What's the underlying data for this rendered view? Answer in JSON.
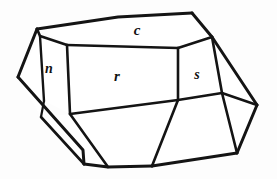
{
  "figure": {
    "name": "crystal-habit-drawing",
    "background_color": "#fdfdfd",
    "line_color": "#141414",
    "face_fill_color": "#ffffff",
    "canvas": {
      "width": 277,
      "height": 179
    }
  },
  "labels": [
    {
      "id": "face-label-c",
      "text": "c",
      "x": 137,
      "y": 32,
      "size": 15
    },
    {
      "id": "face-label-n",
      "text": "n",
      "x": 49,
      "y": 70,
      "size": 14
    },
    {
      "id": "face-label-r",
      "text": "r",
      "x": 117,
      "y": 78,
      "size": 15
    },
    {
      "id": "face-label-s",
      "text": "s",
      "x": 197,
      "y": 76,
      "size": 14
    }
  ],
  "faces": [
    {
      "id": "face-c",
      "label": "c",
      "points": "37,29 118,17 192,13 212,37 178,48 68,44"
    },
    {
      "id": "face-n",
      "label": "n",
      "points": "40,36 67,45 70,114 44,101"
    },
    {
      "id": "face-r",
      "label": "r",
      "points": "67,45 178,48 178,100 70,114"
    },
    {
      "id": "face-s",
      "label": "s",
      "points": "178,48 212,37 222,93 178,100"
    },
    {
      "id": "face-left-sliver",
      "points": "18,77 40,36 44,101 41,117"
    },
    {
      "id": "face-left-lower",
      "points": "18,77 44,101 41,117 84,164 83,150"
    },
    {
      "id": "face-bottom-left",
      "points": "41,117 70,114 108,167 84,164"
    },
    {
      "id": "face-bottom-mid",
      "points": "70,114 178,100 152,166 108,167"
    },
    {
      "id": "face-bottom-right",
      "points": "178,100 222,93 237,153 152,166"
    },
    {
      "id": "face-right-upper",
      "points": "212,37 257,105 222,93"
    },
    {
      "id": "face-right-lower",
      "points": "222,93 257,105 237,153"
    }
  ],
  "edges": [
    {
      "id": "edge-top-rear-left",
      "d": "M 37,29 L 118,17 L 192,13",
      "w": 3.0
    },
    {
      "id": "edge-top-rear-right",
      "d": "M 192,13 L 212,37",
      "w": 3.0
    },
    {
      "id": "edge-c-front-left",
      "d": "M 37,29 L 40,36 L 67,45",
      "w": 2.6
    },
    {
      "id": "edge-c-front-mid",
      "d": "M 67,45 L 178,48",
      "w": 2.6
    },
    {
      "id": "edge-c-front-right",
      "d": "M 178,48 L 212,37",
      "w": 2.6
    },
    {
      "id": "edge-n-left",
      "d": "M 40,36 L 44,101",
      "w": 2.4
    },
    {
      "id": "edge-n-right",
      "d": "M 67,45 L 70,114",
      "w": 2.6
    },
    {
      "id": "edge-upper-left-corner",
      "d": "M 37,29 L 18,77",
      "w": 3.0
    },
    {
      "id": "edge-left-sliver-inner",
      "d": "M 44,101 L 41,117",
      "w": 2.2
    },
    {
      "id": "edge-left-lower-outer",
      "d": "M 18,77 L 83,150 L 84,164",
      "w": 3.0
    },
    {
      "id": "edge-left-lower-inner",
      "d": "M 41,117 L 84,164",
      "w": 2.6
    },
    {
      "id": "edge-bottom-left-seam",
      "d": "M 70,114 L 108,167",
      "w": 2.6
    },
    {
      "id": "edge-bottom-front",
      "d": "M 84,164 L 108,167 L 152,166",
      "w": 3.0
    },
    {
      "id": "edge-bottom-right-front",
      "d": "M 152,166 L 237,153",
      "w": 3.0
    },
    {
      "id": "edge-bottom-mid-seam",
      "d": "M 152,166 L 178,100",
      "w": 2.6
    },
    {
      "id": "edge-r-bottom",
      "d": "M 70,114 L 178,100",
      "w": 2.6
    },
    {
      "id": "edge-s-left",
      "d": "M 178,48 L 178,100",
      "w": 2.6
    },
    {
      "id": "edge-s-bottom",
      "d": "M 178,100 L 222,93",
      "w": 2.6
    },
    {
      "id": "edge-s-right",
      "d": "M 212,37 L 222,93",
      "w": 2.6
    },
    {
      "id": "edge-right-outer-upper",
      "d": "M 212,37 L 257,105",
      "w": 3.0
    },
    {
      "id": "edge-right-outer-lower",
      "d": "M 257,105 L 237,153",
      "w": 3.0
    },
    {
      "id": "edge-right-inner",
      "d": "M 222,93 L 257,105",
      "w": 2.4
    },
    {
      "id": "edge-right-bottom-seam",
      "d": "M 222,93 L 237,153",
      "w": 2.6
    }
  ]
}
